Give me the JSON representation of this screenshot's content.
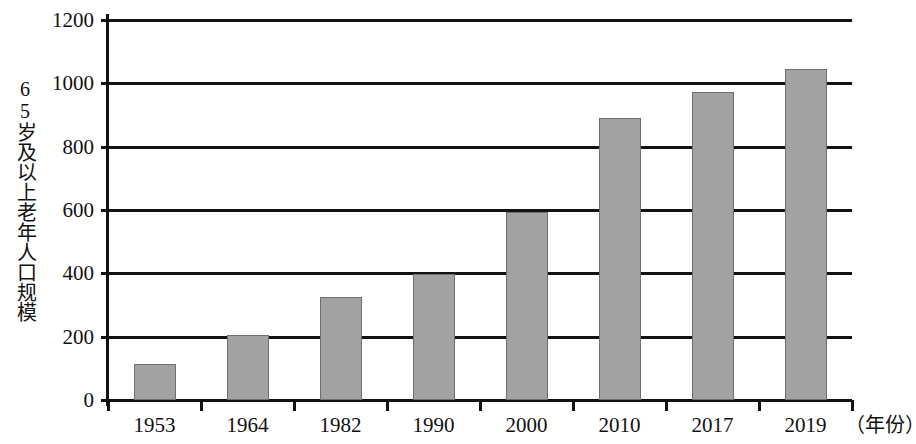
{
  "chart_data": {
    "type": "bar",
    "title": "",
    "subtitle": "",
    "xlabel": "（年份）",
    "ylabel": "65岁及以上老年人口规模",
    "categories": [
      "1953",
      "1964",
      "1982",
      "1990",
      "2000",
      "2010",
      "2017",
      "2019"
    ],
    "values": [
      115,
      205,
      325,
      397,
      594,
      890,
      973,
      1046
    ],
    "series": [
      {
        "name": "65岁及以上老年人口规模",
        "values": [
          115,
          205,
          325,
          397,
          594,
          890,
          973,
          1046
        ]
      }
    ],
    "ylim": [
      0,
      1200
    ],
    "y_ticks": [
      0,
      200,
      400,
      600,
      800,
      1000,
      1200
    ],
    "y_tick_labels": [
      "0",
      "200",
      "400",
      "600",
      "800",
      "1000",
      "1200"
    ],
    "grid": true,
    "legend": false,
    "legend_position": "none",
    "bar_color": "#a2a2a2",
    "bar_edge_color": "#6f6f6f",
    "axis_color": "#121212",
    "background_color": "#ffffff"
  },
  "axes": {
    "y_title": "65岁及以上老年人口规模",
    "x_unit_label": "（年份）"
  }
}
